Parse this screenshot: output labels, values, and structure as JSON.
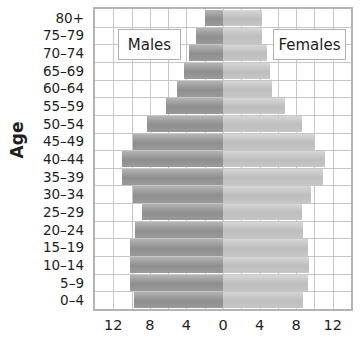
{
  "chart_data": {
    "type": "bar",
    "subtype": "population-pyramid",
    "title": "",
    "ylabel": "Age",
    "xlabel": "",
    "categories": [
      "80+",
      "75–79",
      "70–74",
      "65–69",
      "60–64",
      "55–59",
      "50–54",
      "45–49",
      "40–44",
      "35–39",
      "30–34",
      "25–29",
      "20–24",
      "15–19",
      "10–14",
      "5–9",
      "0–4"
    ],
    "series": [
      {
        "name": "Males",
        "values": [
          2.0,
          2.9,
          3.7,
          4.3,
          5.0,
          6.2,
          8.3,
          9.8,
          11.1,
          11.1,
          9.8,
          8.9,
          9.6,
          10.2,
          10.2,
          10.2,
          9.7
        ]
      },
      {
        "name": "Females",
        "values": [
          4.3,
          4.3,
          4.8,
          5.1,
          5.4,
          6.8,
          8.6,
          9.9,
          11.2,
          10.9,
          9.6,
          8.6,
          8.8,
          9.3,
          9.4,
          9.3,
          8.8
        ]
      }
    ],
    "xlim": [
      -14,
      14
    ],
    "xticks": [
      {
        "value": -12,
        "label": "12"
      },
      {
        "value": -8,
        "label": "8"
      },
      {
        "value": -4,
        "label": "4"
      },
      {
        "value": 0,
        "label": "0"
      },
      {
        "value": 4,
        "label": "4"
      },
      {
        "value": 8,
        "label": "8"
      },
      {
        "value": 12,
        "label": "12"
      }
    ],
    "grid": true,
    "grid_step": 2,
    "legend": [
      "Males",
      "Females"
    ],
    "colors": {
      "males": "#999999",
      "females": "#c4c4c4",
      "grid": "#c6c6c6",
      "border": "#b4b4b4"
    }
  }
}
